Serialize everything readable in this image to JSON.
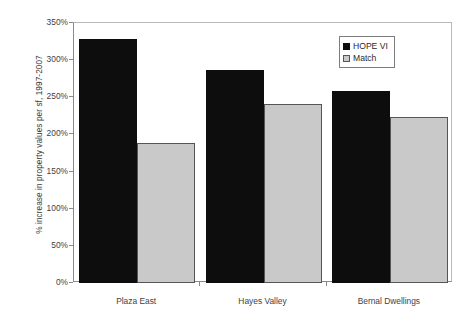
{
  "chart_data": {
    "type": "bar",
    "title": "",
    "xlabel": "",
    "ylabel": "% increase in property values per sf, 1997-2007",
    "categories": [
      "Plaza East",
      "Hayes Valley",
      "Bernal Dwellings"
    ],
    "series": [
      {
        "name": "HOPE VI",
        "color": "#0d0d0d",
        "values": [
          328,
          287,
          259
        ]
      },
      {
        "name": "Match",
        "color": "#c9c9c9",
        "values": [
          189,
          241,
          224
        ]
      }
    ],
    "ylim": [
      0,
      350
    ],
    "ytick_labels": [
      "0%",
      "50%",
      "100%",
      "150%",
      "200%",
      "250%",
      "300%",
      "350%"
    ],
    "ytick_values": [
      0,
      50,
      100,
      150,
      200,
      250,
      300,
      350
    ],
    "grid": false,
    "legend_position": "top-right",
    "value_suffix": "%"
  },
  "legend": {
    "entries": [
      {
        "label": "HOPE VI",
        "swatch": "black-square-icon"
      },
      {
        "label": "Match",
        "swatch": "gray-square-icon"
      }
    ]
  }
}
